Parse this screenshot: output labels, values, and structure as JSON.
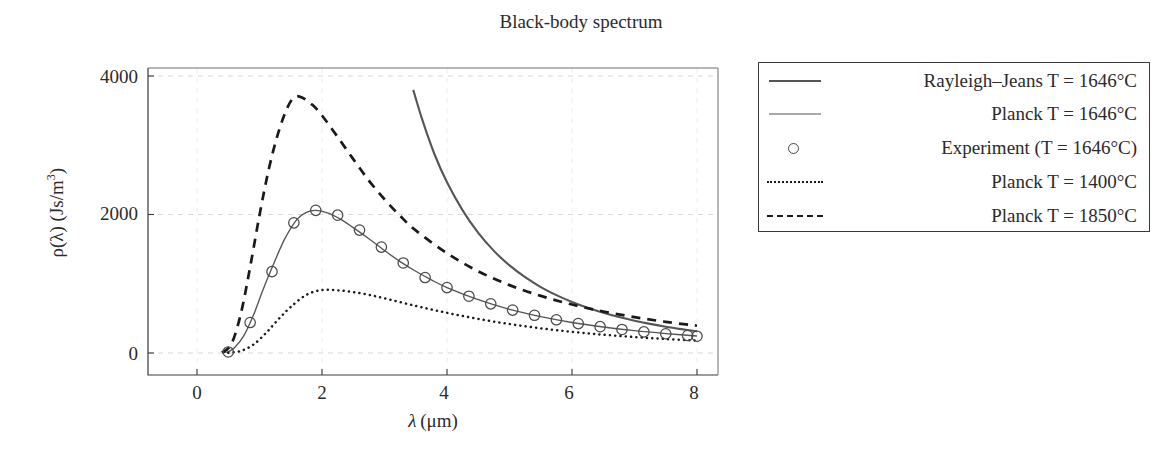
{
  "chart_data": {
    "type": "line",
    "title": "Black-body spectrum",
    "xlabel": "λ (μm)",
    "ylabel": "ρ(λ) (Js/m³)",
    "xlim": [
      -0.5,
      8.35
    ],
    "ylim": [
      -130,
      4120
    ],
    "xticks": [
      0,
      2,
      4,
      6,
      8
    ],
    "xtick_labels": [
      "0",
      "2",
      "4",
      "6",
      "8"
    ],
    "yticks": [
      0,
      2000,
      4000
    ],
    "ytick_labels": [
      "0",
      "2000",
      "4000"
    ],
    "grid": true,
    "grid_style": "dashed-light-gray",
    "legend_position": "right-outside",
    "series": [
      {
        "name": "Rayleigh–Jeans T = 1646°C",
        "style": "solid",
        "color": "#555555",
        "x": [
          3.46,
          3.6,
          3.8,
          4.0,
          4.25,
          4.5,
          4.75,
          5.0,
          5.25,
          5.5,
          5.75,
          6.0,
          6.25,
          6.5,
          6.75,
          7.0,
          7.25,
          7.5,
          7.75,
          8.0
        ],
        "y": [
          3800,
          3380,
          2870,
          2465,
          2060,
          1735,
          1475,
          1265,
          1095,
          952,
          836,
          737,
          653,
          581,
          520,
          467,
          421,
          380,
          345,
          313
        ]
      },
      {
        "name": "Planck T = 1646°C",
        "style": "solid",
        "color": "#555555",
        "x": [
          0.4,
          0.5,
          0.6,
          0.75,
          0.9,
          1.05,
          1.2,
          1.4,
          1.6,
          1.75,
          1.9,
          2.1,
          2.3,
          2.5,
          2.75,
          3.0,
          3.25,
          3.5,
          3.75,
          4.0,
          4.5,
          5.0,
          5.5,
          6.0,
          6.5,
          7.0,
          7.5,
          8.0
        ],
        "y": [
          2,
          18,
          75,
          250,
          540,
          900,
          1230,
          1640,
          1930,
          2030,
          2060,
          2020,
          1930,
          1810,
          1650,
          1480,
          1320,
          1180,
          1055,
          945,
          770,
          630,
          525,
          440,
          375,
          322,
          280,
          245
        ]
      },
      {
        "name": "Experiment (T = 1646°C)",
        "style": "markers",
        "marker": "circle-open",
        "color": "#4a4a4a",
        "x": [
          0.5,
          0.85,
          1.2,
          1.55,
          1.9,
          2.25,
          2.6,
          2.95,
          3.3,
          3.65,
          4.0,
          4.35,
          4.7,
          5.05,
          5.4,
          5.75,
          6.1,
          6.45,
          6.8,
          7.15,
          7.5,
          7.85,
          8.0
        ],
        "y": [
          15,
          440,
          1175,
          1880,
          2060,
          1990,
          1775,
          1530,
          1300,
          1090,
          945,
          820,
          710,
          620,
          545,
          480,
          425,
          380,
          340,
          305,
          278,
          252,
          242
        ]
      },
      {
        "name": "Planck T = 1400°C",
        "style": "dotted",
        "color": "#1a1a1a",
        "x": [
          0.5,
          0.7,
          0.9,
          1.1,
          1.3,
          1.5,
          1.75,
          2.0,
          2.25,
          2.5,
          2.75,
          3.0,
          3.5,
          4.0,
          4.5,
          5.0,
          5.5,
          6.0,
          6.5,
          7.0,
          7.5,
          8.0
        ],
        "y": [
          3,
          30,
          120,
          285,
          485,
          665,
          840,
          910,
          905,
          880,
          840,
          790,
          680,
          580,
          492,
          418,
          356,
          305,
          264,
          230,
          202,
          178
        ]
      },
      {
        "name": "Planck T = 1850°C",
        "style": "dashed",
        "color": "#1a1a1a",
        "x": [
          0.4,
          0.55,
          0.7,
          0.85,
          1.0,
          1.15,
          1.3,
          1.45,
          1.57,
          1.7,
          1.85,
          2.0,
          2.25,
          2.5,
          2.75,
          3.0,
          3.25,
          3.5,
          4.0,
          4.5,
          5.0,
          5.5,
          6.0,
          6.5,
          7.0,
          7.5,
          8.0
        ],
        "y": [
          6,
          130,
          560,
          1240,
          1990,
          2660,
          3180,
          3550,
          3700,
          3680,
          3580,
          3430,
          3120,
          2800,
          2490,
          2220,
          1980,
          1770,
          1440,
          1180,
          980,
          825,
          700,
          600,
          518,
          450,
          394
        ]
      }
    ]
  },
  "axes": {
    "title": "Black-body spectrum",
    "xlabel_lambda": "λ",
    "xlabel_unit": "(μm)",
    "ylabel": "ρ(λ) (Js/m",
    "ylabel_exp": "3",
    "ylabel_close": ")",
    "ytick_0": "0",
    "ytick_2000": "2000",
    "ytick_4000": "4000",
    "xtick_0": "0",
    "xtick_2": "2",
    "xtick_4": "4",
    "xtick_6": "6",
    "xtick_8": "8"
  },
  "legend": {
    "entries": [
      {
        "label": "Rayleigh–Jeans T = 1646°C",
        "sample": "solid-line"
      },
      {
        "label": "Planck T = 1646°C",
        "sample": "solid-line"
      },
      {
        "label": "Experiment (T = 1646°C)",
        "sample": "open-circle-marker"
      },
      {
        "label": "Planck T = 1400°C",
        "sample": "dotted-line"
      },
      {
        "label": "Planck T = 1850°C",
        "sample": "dashed-line"
      }
    ]
  },
  "colors": {
    "axis": "#3a3a3a",
    "grid": "#d8d8d8",
    "curve_gray": "#555555",
    "curve_black": "#1a1a1a",
    "text": "#2b2b2b",
    "background": "#ffffff"
  }
}
